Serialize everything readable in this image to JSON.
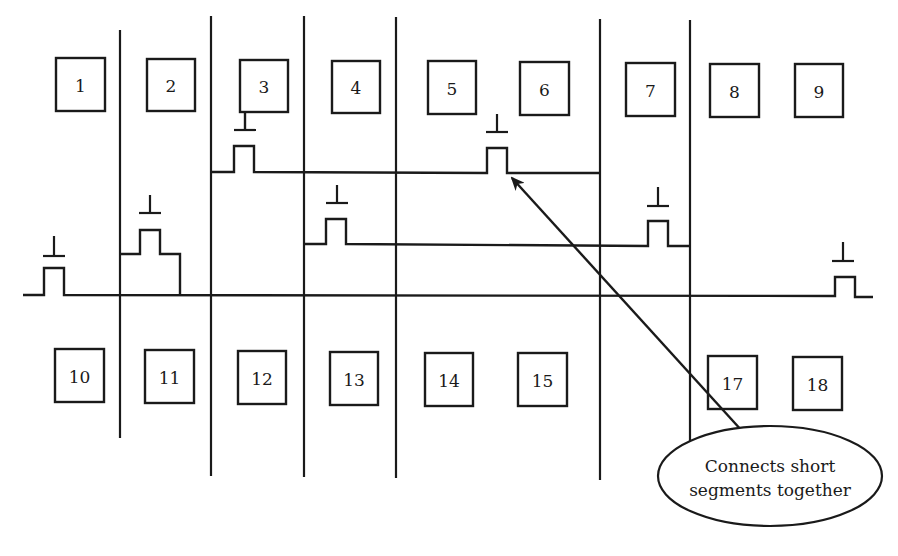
{
  "diagram": {
    "colors": {
      "stroke": "#1a1a1a",
      "background": "#ffffff"
    },
    "top_cells": [
      {
        "label": "1",
        "x": 56,
        "y": 58,
        "w": 49,
        "h": 53
      },
      {
        "label": "2",
        "x": 147,
        "y": 59,
        "w": 48,
        "h": 52
      },
      {
        "label": "3",
        "x": 240,
        "y": 60,
        "w": 48,
        "h": 52
      },
      {
        "label": "4",
        "x": 332,
        "y": 61,
        "w": 48,
        "h": 52
      },
      {
        "label": "5",
        "x": 428,
        "y": 61,
        "w": 48,
        "h": 53
      },
      {
        "label": "6",
        "x": 520,
        "y": 62,
        "w": 49,
        "h": 53
      },
      {
        "label": "7",
        "x": 626,
        "y": 63,
        "w": 49,
        "h": 53
      },
      {
        "label": "8",
        "x": 710,
        "y": 64,
        "w": 49,
        "h": 53
      },
      {
        "label": "9",
        "x": 795,
        "y": 64,
        "w": 48,
        "h": 53
      }
    ],
    "bottom_cells": [
      {
        "label": "10",
        "x": 55,
        "y": 349,
        "w": 49,
        "h": 53
      },
      {
        "label": "11",
        "x": 145,
        "y": 350,
        "w": 49,
        "h": 53
      },
      {
        "label": "12",
        "x": 238,
        "y": 351,
        "w": 48,
        "h": 53
      },
      {
        "label": "13",
        "x": 330,
        "y": 352,
        "w": 48,
        "h": 53
      },
      {
        "label": "14",
        "x": 425,
        "y": 353,
        "w": 48,
        "h": 53
      },
      {
        "label": "15",
        "x": 518,
        "y": 353,
        "w": 49,
        "h": 53
      },
      {
        "label": "17",
        "x": 708,
        "y": 356,
        "w": 49,
        "h": 53
      },
      {
        "label": "18",
        "x": 793,
        "y": 357,
        "w": 49,
        "h": 53
      }
    ],
    "vertical_lines": [
      {
        "x": 120,
        "y1": 30,
        "y2": 438
      },
      {
        "x": 211,
        "y1": 16,
        "y2": 476
      },
      {
        "x": 304,
        "y1": 16,
        "y2": 477
      },
      {
        "x": 396,
        "y1": 17,
        "y2": 478
      },
      {
        "x": 600,
        "y1": 19,
        "y2": 480
      },
      {
        "x": 690,
        "y1": 20,
        "y2": 445
      }
    ],
    "wires": [
      {
        "name": "main-wire",
        "d": "M23 295 L44 295 L44 268 L64 268 L64 295 L835 296 L835 277 L855 277 L855 297 L873 297"
      },
      {
        "name": "upper-segment-wire",
        "d": "M211 172 L234 172 L234 146 L254 146 L254 172 L487 173 L487 148 L507 148 L507 173 L600 173"
      },
      {
        "name": "middle-segment-wire",
        "d": "M304 244 L326 244 L326 219 L346 219 L346 244 L648 246 L648 221 L668 221 L668 246 L690 246"
      },
      {
        "name": "column2-segment-wire",
        "d": "M120 254 L140 254 L140 230 L160 230 L160 254 L180 254 L180 295"
      }
    ],
    "gate_symbols": [
      {
        "x": 54,
        "y": 256,
        "stem_top": 236
      },
      {
        "x": 150,
        "y": 213,
        "stem_top": 195
      },
      {
        "x": 245,
        "y": 130,
        "stem_top": 112
      },
      {
        "x": 337,
        "y": 203,
        "stem_top": 185
      },
      {
        "x": 497,
        "y": 132,
        "stem_top": 114
      },
      {
        "x": 658,
        "y": 206,
        "stem_top": 187
      },
      {
        "x": 843,
        "y": 261,
        "stem_top": 242
      }
    ],
    "arrow": {
      "x1": 743,
      "y1": 432,
      "x2": 512,
      "y2": 178
    },
    "callout": {
      "cx": 770,
      "cy": 476,
      "rx": 112,
      "ry": 50,
      "line1": "Connects short",
      "line2": "segments together"
    }
  }
}
